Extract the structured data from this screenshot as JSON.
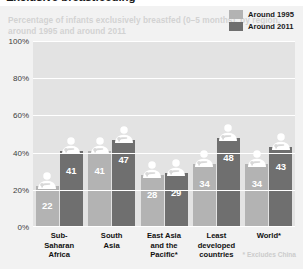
{
  "figure": {
    "title": "Exclusive breastfeeding",
    "subtitle": "Percentage of infants exclusively breastfed (0–5 months), by region, around 1995 and around 2011",
    "footnote": "* Excludes China"
  },
  "legend": {
    "items": [
      {
        "label": "Around 1995",
        "color": "#b3b3b3"
      },
      {
        "label": "Around 2011",
        "color": "#6f6f6f"
      }
    ]
  },
  "yaxis": {
    "ticks": [
      "100%",
      "80%",
      "60%",
      "40%",
      "20%",
      "0%"
    ]
  },
  "chart_data": {
    "type": "bar",
    "title": "Exclusive breastfeeding",
    "subtitle": "Percentage of infants exclusively breastfed (0–5 months), by region, around 1995 and around 2011",
    "xlabel": "",
    "ylabel": "",
    "ylim": [
      0,
      100
    ],
    "yticks": [
      0,
      20,
      40,
      60,
      80,
      100
    ],
    "ytick_labels": [
      "0%",
      "20%",
      "40%",
      "60%",
      "80%",
      "100%"
    ],
    "grid": true,
    "legend_position": "top-right",
    "categories": [
      "Sub-Saharan Africa",
      "South Asia",
      "East Asia and the Pacific*",
      "Least developed countries",
      "World*"
    ],
    "series": [
      {
        "name": "Around 1995",
        "color": "#b3b3b3",
        "values": [
          22,
          41,
          28,
          34,
          34
        ]
      },
      {
        "name": "Around 2011",
        "color": "#6f6f6f",
        "values": [
          41,
          47,
          29,
          48,
          43
        ]
      }
    ],
    "annotations": [
      "* Excludes China"
    ]
  },
  "bars": [
    {
      "category_lines": [
        "Sub-",
        "Saharan",
        "Africa"
      ],
      "values": [
        {
          "label": "22",
          "value": 22,
          "series": "Around 1995"
        },
        {
          "label": "41",
          "value": 41,
          "series": "Around 2011"
        }
      ]
    },
    {
      "category_lines": [
        "South",
        "Asia"
      ],
      "values": [
        {
          "label": "41",
          "value": 41,
          "series": "Around 1995"
        },
        {
          "label": "47",
          "value": 47,
          "series": "Around 2011"
        }
      ]
    },
    {
      "category_lines": [
        "East Asia",
        "and the",
        "Pacific*"
      ],
      "values": [
        {
          "label": "28",
          "value": 28,
          "series": "Around 1995"
        },
        {
          "label": "29",
          "value": 29,
          "series": "Around 2011"
        }
      ]
    },
    {
      "category_lines": [
        "Least",
        "developed",
        "countries"
      ],
      "values": [
        {
          "label": "34",
          "value": 34,
          "series": "Around 1995"
        },
        {
          "label": "48",
          "value": 48,
          "series": "Around 2011"
        }
      ]
    },
    {
      "category_lines": [
        "World*"
      ],
      "values": [
        {
          "label": "34",
          "value": 34,
          "series": "Around 1995"
        },
        {
          "label": "43",
          "value": 43,
          "series": "Around 2011"
        }
      ]
    }
  ]
}
